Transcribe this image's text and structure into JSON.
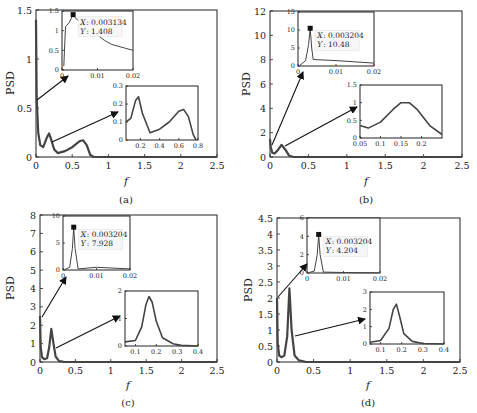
{
  "figure": {
    "line_color": "#444444",
    "axis_color": "#222222",
    "background": "#ffffff"
  },
  "chart_data": [
    {
      "panel": "a",
      "type": "line",
      "caption": "(a)",
      "xlabel": "f",
      "ylabel": "PSD",
      "xlim": [
        0,
        2.5
      ],
      "ylim": [
        0,
        1.5
      ],
      "xticks": [
        "0",
        "0.5",
        "1",
        "1.5",
        "2",
        "2.5"
      ],
      "yticks": [
        "0",
        "0.5",
        "1",
        "1.5"
      ],
      "grid": false,
      "series": [
        {
          "name": "PSD",
          "x": [
            0,
            0.01,
            0.03,
            0.06,
            0.1,
            0.15,
            0.18,
            0.2,
            0.25,
            0.3,
            0.4,
            0.5,
            0.6,
            0.65,
            0.7,
            0.75,
            0.8,
            2.5
          ],
          "y": [
            1.4,
            0.6,
            0.25,
            0.12,
            0.1,
            0.2,
            0.24,
            0.2,
            0.08,
            0.04,
            0.06,
            0.1,
            0.16,
            0.17,
            0.12,
            0.02,
            0.0,
            0.0
          ]
        }
      ],
      "insets": [
        {
          "position": "upper",
          "xlim": [
            0,
            0.02
          ],
          "ylim": [
            0,
            1.5
          ],
          "xticks": [
            "0",
            "0.01",
            "0.02"
          ],
          "yticks": [
            "0",
            "0.5",
            "1",
            "1.5"
          ],
          "x": [
            0.0005,
            0.001,
            0.002,
            0.003134,
            0.004,
            0.012,
            0.014,
            0.016,
            0.018,
            0.02
          ],
          "y": [
            0.1,
            1.1,
            1.2,
            1.408,
            1.3,
            0.75,
            0.65,
            0.6,
            0.55,
            0.5
          ],
          "datatip": {
            "x_label": "X",
            "x_value": "0.003134",
            "y_label": "Y",
            "y_value": "1.408"
          }
        },
        {
          "position": "lower",
          "xlim": [
            0.05,
            0.8
          ],
          "ylim": [
            0,
            0.3
          ],
          "xticks": [
            "0.2",
            "0.4",
            "0.6",
            "0.8"
          ],
          "yticks": [
            "0",
            "0.1",
            "0.2",
            "0.3"
          ],
          "x": [
            0.05,
            0.1,
            0.15,
            0.18,
            0.22,
            0.3,
            0.4,
            0.5,
            0.6,
            0.65,
            0.7,
            0.75,
            0.78
          ],
          "y": [
            0.1,
            0.12,
            0.22,
            0.24,
            0.15,
            0.04,
            0.06,
            0.1,
            0.16,
            0.17,
            0.13,
            0.03,
            0.0
          ]
        }
      ]
    },
    {
      "panel": "b",
      "type": "line",
      "caption": "(b)",
      "xlabel": "f",
      "ylabel": "PSD",
      "xlim": [
        0,
        2.5
      ],
      "ylim": [
        0,
        12
      ],
      "xticks": [
        "0",
        "0.5",
        "1",
        "1.5",
        "2",
        "2.5"
      ],
      "yticks": [
        "0",
        "2",
        "4",
        "6",
        "8",
        "10",
        "12"
      ],
      "grid": false,
      "series": [
        {
          "name": "PSD",
          "x": [
            0,
            0.01,
            0.03,
            0.06,
            0.1,
            0.15,
            0.2,
            0.25,
            0.3,
            0.4,
            2.5
          ],
          "y": [
            1.5,
            0.8,
            0.35,
            0.28,
            0.55,
            1.0,
            0.6,
            0.1,
            0.02,
            0.0,
            0.0
          ]
        }
      ],
      "insets": [
        {
          "position": "upper",
          "xlim": [
            0,
            0.02
          ],
          "ylim": [
            0,
            15
          ],
          "xticks": [
            "0",
            "0.01",
            "0.02"
          ],
          "yticks": [
            "0",
            "5",
            "10",
            "15"
          ],
          "x": [
            0.0005,
            0.002,
            0.0028,
            0.003204,
            0.0036,
            0.004,
            0.01,
            0.02
          ],
          "y": [
            0.2,
            1.5,
            6,
            10.48,
            5,
            1.8,
            1.5,
            0.8
          ],
          "datatip": {
            "x_label": "X",
            "x_value": "0.003204",
            "y_label": "Y",
            "y_value": "10.48"
          }
        },
        {
          "position": "lower",
          "xlim": [
            0.05,
            0.25
          ],
          "ylim": [
            0,
            1.5
          ],
          "xticks": [
            "0.05",
            "0.1",
            "0.15",
            "0.2"
          ],
          "yticks": [
            "0",
            "0.5",
            "1",
            "1.5"
          ],
          "x": [
            0.05,
            0.07,
            0.1,
            0.13,
            0.15,
            0.17,
            0.19,
            0.22,
            0.25
          ],
          "y": [
            0.35,
            0.28,
            0.45,
            0.8,
            1.0,
            1.0,
            0.8,
            0.35,
            0.1
          ]
        }
      ]
    },
    {
      "panel": "c",
      "type": "line",
      "caption": "(c)",
      "xlabel": "f",
      "ylabel": "PSD",
      "xlim": [
        0,
        2.5
      ],
      "ylim": [
        0,
        8
      ],
      "xticks": [
        "0",
        "0.5",
        "1",
        "1.5",
        "2",
        "2.5"
      ],
      "yticks": [
        "0",
        "1",
        "2",
        "3",
        "4",
        "5",
        "6",
        "7",
        "8"
      ],
      "grid": false,
      "series": [
        {
          "name": "PSD",
          "x": [
            0,
            0.01,
            0.03,
            0.06,
            0.1,
            0.13,
            0.16,
            0.19,
            0.22,
            0.27,
            0.35,
            2.5
          ],
          "y": [
            2.5,
            0.8,
            0.25,
            0.15,
            0.2,
            0.8,
            1.8,
            1.0,
            0.3,
            0.05,
            0.0,
            0.0
          ]
        }
      ],
      "insets": [
        {
          "position": "upper",
          "xlim": [
            0,
            0.02
          ],
          "ylim": [
            0,
            10
          ],
          "xticks": [
            "0",
            "0.01",
            "0.02"
          ],
          "yticks": [
            "0",
            "5",
            "10"
          ],
          "x": [
            0.0005,
            0.002,
            0.0028,
            0.003204,
            0.0036,
            0.0045,
            0.01,
            0.02
          ],
          "y": [
            0.1,
            0.5,
            4,
            7.928,
            4,
            0.2,
            0.5,
            0.2
          ],
          "datatip": {
            "x_label": "X",
            "x_value": "0.003204",
            "y_label": "Y",
            "y_value": "7.928"
          }
        },
        {
          "position": "lower",
          "xlim": [
            0.05,
            0.4
          ],
          "ylim": [
            0,
            2
          ],
          "xticks": [
            "0.1",
            "0.2",
            "0.3",
            "0.4"
          ],
          "yticks": [
            "0",
            "1",
            "2"
          ],
          "x": [
            0.05,
            0.1,
            0.13,
            0.15,
            0.165,
            0.18,
            0.2,
            0.23,
            0.28,
            0.32,
            0.4
          ],
          "y": [
            0.15,
            0.2,
            0.7,
            1.5,
            1.8,
            1.6,
            0.9,
            0.3,
            0.08,
            0.02,
            0.0
          ]
        }
      ]
    },
    {
      "panel": "d",
      "type": "line",
      "caption": "(d)",
      "xlabel": "f",
      "ylabel": "PSD",
      "xlim": [
        0,
        2.5
      ],
      "ylim": [
        0,
        4.5
      ],
      "xticks": [
        "0",
        "0.5",
        "1",
        "1.5",
        "2",
        "2.5"
      ],
      "yticks": [
        "0",
        "0.5",
        "1",
        "1.5",
        "2",
        "2.5",
        "3",
        "3.5",
        "4",
        "4.5"
      ],
      "grid": false,
      "series": [
        {
          "name": "PSD",
          "x": [
            0,
            0.01,
            0.03,
            0.06,
            0.1,
            0.14,
            0.17,
            0.2,
            0.24,
            0.3,
            0.4,
            2.5
          ],
          "y": [
            2.0,
            0.6,
            0.2,
            0.15,
            0.2,
            0.8,
            2.3,
            1.0,
            0.2,
            0.05,
            0.0,
            0.0
          ]
        }
      ],
      "insets": [
        {
          "position": "upper",
          "xlim": [
            0,
            0.02
          ],
          "ylim": [
            0,
            6
          ],
          "xticks": [
            "0",
            "0.01",
            "0.02"
          ],
          "yticks": [
            "0",
            "2",
            "4",
            "6"
          ],
          "x": [
            0.0005,
            0.002,
            0.0028,
            0.003204,
            0.0036,
            0.0045,
            0.01,
            0.02
          ],
          "y": [
            0.05,
            0.2,
            2,
            4.204,
            2,
            0.1,
            0.05,
            0.02
          ],
          "datatip": {
            "x_label": "X",
            "x_value": "0.003204",
            "y_label": "Y",
            "y_value": "4.204"
          }
        },
        {
          "position": "lower",
          "xlim": [
            0.05,
            0.4
          ],
          "ylim": [
            0,
            3
          ],
          "xticks": [
            "0.1",
            "0.2",
            "0.3",
            "0.4"
          ],
          "yticks": [
            "0",
            "1",
            "2",
            "3"
          ],
          "x": [
            0.05,
            0.1,
            0.14,
            0.16,
            0.175,
            0.19,
            0.21,
            0.25,
            0.3,
            0.4
          ],
          "y": [
            0.1,
            0.2,
            0.9,
            2.0,
            2.3,
            1.6,
            0.6,
            0.15,
            0.03,
            0.0
          ]
        }
      ]
    }
  ],
  "layout": {
    "panels": [
      {
        "frame": [
          36,
          10,
          217,
          157
        ],
        "ylab_x": 14,
        "cap_y": 205,
        "xlab_y": 185,
        "insets": [
          {
            "frame": [
              62,
              11,
              133,
              70
            ]
          },
          {
            "frame": [
              126,
              86,
              198,
              140
            ]
          }
        ],
        "arrows": [
          {
            "from": [
              37,
              100
            ],
            "to": [
              68,
              76
            ]
          },
          {
            "from": [
              52,
              142
            ],
            "to": [
              118,
              112
            ]
          }
        ]
      },
      {
        "frame": [
          270,
          11,
          462,
          157
        ],
        "ylab_x": 248,
        "cap_y": 205,
        "xlab_y": 185,
        "insets": [
          {
            "frame": [
              298,
              12,
              374,
              66
            ]
          },
          {
            "frame": [
              360,
              85,
              442,
              138
            ]
          }
        ],
        "arrows": [
          {
            "from": [
              272,
              145
            ],
            "to": [
              303,
              72
            ]
          },
          {
            "from": [
              285,
              146
            ],
            "to": [
              357,
              107
            ]
          }
        ]
      },
      {
        "frame": [
          40,
          215,
          217,
          362
        ],
        "ylab_x": 14,
        "cap_y": 406,
        "xlab_y": 388,
        "insets": [
          {
            "frame": [
              63,
              216,
              130,
              270
            ]
          },
          {
            "frame": [
              125,
              291,
              198,
              346
            ]
          }
        ],
        "arrows": [
          {
            "from": [
              42,
              317
            ],
            "to": [
              66,
              277
            ]
          },
          {
            "from": [
              56,
              348
            ],
            "to": [
              120,
              316
            ]
          }
        ]
      },
      {
        "frame": [
          277,
          218,
          460,
          362
        ],
        "ylab_x": 252,
        "cap_y": 406,
        "xlab_y": 388,
        "insets": [
          {
            "frame": [
              307,
              218,
              380,
              273
            ]
          },
          {
            "frame": [
              370,
              292,
              444,
              344
            ]
          }
        ],
        "arrows": [
          {
            "from": [
              278,
              297
            ],
            "to": [
              307,
              264
            ]
          },
          {
            "from": [
              295,
              336
            ],
            "to": [
              365,
              319
            ]
          }
        ]
      }
    ]
  }
}
